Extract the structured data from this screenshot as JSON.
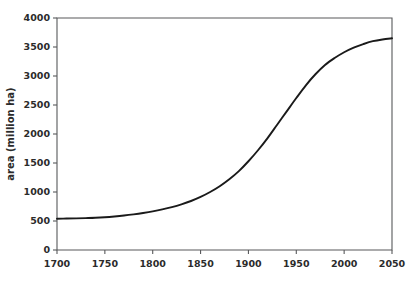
{
  "chart_data": {
    "type": "line",
    "title": "",
    "subtitle": "",
    "xlabel": "",
    "ylabel": "area (million ha)",
    "xlim": [
      1700,
      2050
    ],
    "ylim": [
      0,
      4000
    ],
    "grid": false,
    "legend": null,
    "legend_position": "none",
    "annotations": [],
    "xticks": [
      1700,
      1750,
      1800,
      1850,
      1900,
      1950,
      2000,
      2050
    ],
    "xtick_labels": [
      "1700",
      "1750",
      "1800",
      "1850",
      "1900",
      "1950",
      "2000",
      "2050"
    ],
    "yticks": [
      0,
      500,
      1000,
      1500,
      2000,
      2500,
      3000,
      3500,
      4000
    ],
    "ytick_labels": [
      "0",
      "500",
      "1000",
      "1500",
      "2000",
      "2500",
      "3000",
      "3500",
      "4000"
    ],
    "series": [
      {
        "name": "cropland area",
        "color": "#1a1a1a",
        "x": [
          1700,
          1710,
          1720,
          1730,
          1740,
          1750,
          1760,
          1770,
          1780,
          1790,
          1800,
          1810,
          1820,
          1830,
          1840,
          1850,
          1860,
          1870,
          1880,
          1890,
          1900,
          1910,
          1920,
          1930,
          1940,
          1950,
          1960,
          1970,
          1980,
          1990,
          2000,
          2010,
          2020,
          2030,
          2040,
          2050
        ],
        "y": [
          540,
          542,
          545,
          550,
          556,
          565,
          578,
          594,
          614,
          638,
          666,
          700,
          740,
          788,
          845,
          915,
          1000,
          1100,
          1220,
          1360,
          1530,
          1720,
          1930,
          2160,
          2390,
          2620,
          2840,
          3030,
          3190,
          3310,
          3410,
          3490,
          3550,
          3600,
          3630,
          3650
        ]
      }
    ]
  },
  "axes": {
    "y_axis_title": "area (million ha)"
  },
  "colors": {
    "curve": "#1a1a1a",
    "axis": "#58595b",
    "background": "#ffffff",
    "text": "#2b2b2b"
  }
}
